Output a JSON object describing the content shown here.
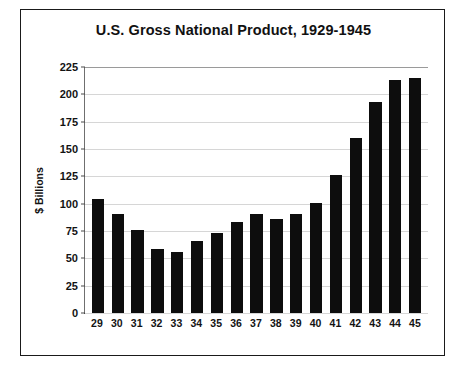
{
  "chart_data": {
    "type": "bar",
    "title": "U.S. Gross National Product, 1929-1945",
    "xlabel": "",
    "ylabel": "$ Billions",
    "categories": [
      "29",
      "30",
      "31",
      "32",
      "33",
      "34",
      "35",
      "36",
      "37",
      "38",
      "39",
      "40",
      "41",
      "42",
      "43",
      "44",
      "45"
    ],
    "values": [
      104,
      91,
      76,
      59,
      56,
      66,
      73,
      83,
      91,
      86,
      91,
      101,
      126,
      160,
      193,
      213,
      215
    ],
    "ylim": [
      0,
      225
    ],
    "yticks": [
      "0",
      "25",
      "50",
      "75",
      "100",
      "125",
      "150",
      "175",
      "200",
      "225"
    ],
    "ytick_values": [
      0,
      25,
      50,
      75,
      100,
      125,
      150,
      175,
      200,
      225
    ],
    "grid": true,
    "legend": "none",
    "bar_color": "#0d0d0d",
    "plot_background": "#ffffff",
    "frame_color": "#1a1a1a",
    "gridline_color": "#d6d6d6"
  }
}
